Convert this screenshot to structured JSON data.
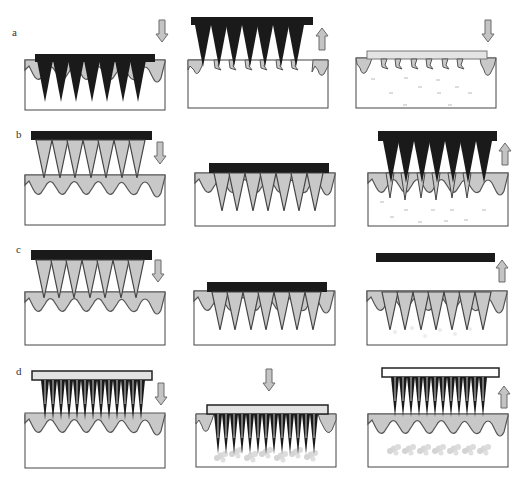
{
  "figure": {
    "rows": [
      {
        "label": "a",
        "description": "Solid microneedles: poke with patch, then remove and apply drug patch"
      },
      {
        "label": "b",
        "description": "Coated microneedles: drug coating dissolves in skin, then needles removed"
      },
      {
        "label": "c",
        "description": "Dissolving microneedles: needles dissolve in skin, backing removed"
      },
      {
        "label": "d",
        "description": "Hollow microneedles: drug injected through needles into skin"
      }
    ],
    "colors": {
      "needle_dark": "#1a1a1a",
      "skin_fill": "#c8c8c8",
      "skin_outline": "#555555",
      "arrow_fill": "#c4c4c4",
      "arrow_outline": "#6a6a6a",
      "box_outline": "#444444"
    },
    "arrows": {
      "a1": "down",
      "a2": "up",
      "a3": "down",
      "b1": "down",
      "b3": "up",
      "c1": "down",
      "c3": "up",
      "d1": "down",
      "d2": "down",
      "d3": "up"
    }
  }
}
